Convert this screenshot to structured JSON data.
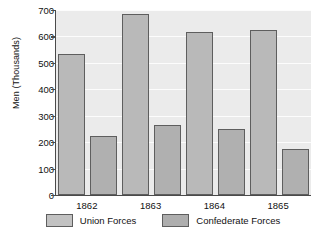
{
  "chart_data": {
    "type": "bar",
    "title": "",
    "xlabel": "",
    "ylabel": "Men (Thousands)",
    "categories": [
      "1862",
      "1863",
      "1864",
      "1865"
    ],
    "series": [
      {
        "name": "Union Forces",
        "values": [
          535,
          685,
          615,
          625
        ],
        "color": "#b9b9b9"
      },
      {
        "name": "Confederate Forces",
        "values": [
          222,
          265,
          250,
          175
        ],
        "color": "#b0b0b0"
      }
    ],
    "ylim": [
      0,
      700
    ],
    "yticks": [
      0,
      100,
      200,
      300,
      400,
      500,
      600,
      700
    ],
    "ytick_labels": [
      "0",
      "100",
      "200",
      "300",
      "400",
      "500",
      "600",
      "700"
    ],
    "grid": true,
    "legend_position": "bottom"
  },
  "legend": {
    "entries": [
      {
        "label": "Union Forces",
        "swatch": "union-swatch"
      },
      {
        "label": "Confederate Forces",
        "swatch": "confederate-swatch"
      }
    ]
  },
  "axes": {
    "y_title": "Men (Thousands)"
  }
}
